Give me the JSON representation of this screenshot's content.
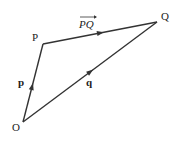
{
  "diagram": {
    "type": "vector-triangle",
    "points": {
      "O": {
        "label": "O"
      },
      "P": {
        "label": "P"
      },
      "Q": {
        "label": "Q"
      }
    },
    "vectors": [
      {
        "id": "p",
        "from": "O",
        "to": "P",
        "label": "p",
        "style": "bold"
      },
      {
        "id": "q",
        "from": "O",
        "to": "Q",
        "label": "q",
        "style": "bold"
      },
      {
        "id": "PQ",
        "from": "P",
        "to": "Q",
        "label": "PQ",
        "style": "italic-overarrow"
      }
    ],
    "colors": {
      "stroke": "#333333",
      "text": "#222222",
      "background": "#ffffff"
    }
  }
}
